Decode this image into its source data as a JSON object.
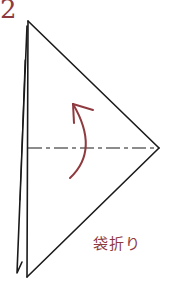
{
  "step": {
    "number": "2"
  },
  "caption": {
    "text": "袋折り"
  },
  "colors": {
    "line": "#1a1a1a",
    "accent": "#8e3a3f",
    "background": "#ffffff"
  },
  "diagram": {
    "shape": "folded-triangle",
    "fold_line": "dash-dot-horizontal",
    "arrow": "curved-fold-arrow-up"
  }
}
